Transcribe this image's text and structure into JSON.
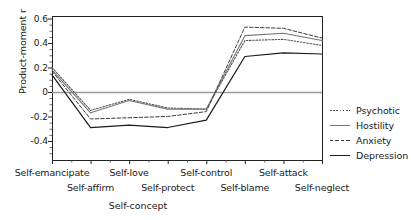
{
  "chart_data": {
    "type": "line",
    "title": "",
    "xlabel": "Self-concept",
    "ylabel": "Product-moment r",
    "categories": [
      "Self-emancipate",
      "Self-affirm",
      "Self-love",
      "Self-protect",
      "Self-control",
      "Self-blame",
      "Self-attack",
      "Self-neglect"
    ],
    "xtick_rows": {
      "top": [
        "Self-emancipate",
        "Self-love",
        "Self-control",
        "Self-attack"
      ],
      "bottom": [
        "Self-affirm",
        "Self-protect",
        "Self-blame",
        "Self-neglect"
      ]
    },
    "ylim": [
      -0.5,
      0.63
    ],
    "yticks": [
      0.6,
      0.4,
      0.2,
      0,
      -0.2,
      -0.4
    ],
    "ytick_labels": [
      "0.6",
      "0.4",
      "0.2",
      "0",
      "-0.2",
      "-0.4"
    ],
    "grid": false,
    "zero_line": true,
    "legend_position": "right",
    "series": [
      {
        "name": "Psychotic",
        "style": "dotted",
        "color": "#555555",
        "values": [
          0.2,
          -0.15,
          -0.06,
          -0.13,
          -0.14,
          0.42,
          0.43,
          0.38
        ]
      },
      {
        "name": "Hostility",
        "style": "solid-light",
        "color": "#767676",
        "values": [
          0.18,
          -0.17,
          -0.07,
          -0.14,
          -0.14,
          0.46,
          0.48,
          0.42
        ]
      },
      {
        "name": "Anxiety",
        "style": "dashed",
        "color": "#3a3a3a",
        "values": [
          0.17,
          -0.22,
          -0.21,
          -0.2,
          -0.16,
          0.53,
          0.52,
          0.44
        ]
      },
      {
        "name": "Depression",
        "style": "solid-dark",
        "color": "#1a1a1a",
        "values": [
          0.14,
          -0.29,
          -0.27,
          -0.29,
          -0.23,
          0.29,
          0.32,
          0.31
        ]
      }
    ]
  },
  "legend": {
    "items": [
      {
        "label": "Psychotic"
      },
      {
        "label": "Hostility"
      },
      {
        "label": "Anxiety"
      },
      {
        "label": "Depression"
      }
    ]
  },
  "axes": {
    "y_title": "Product-moment r",
    "x_title": "Self-concept"
  }
}
